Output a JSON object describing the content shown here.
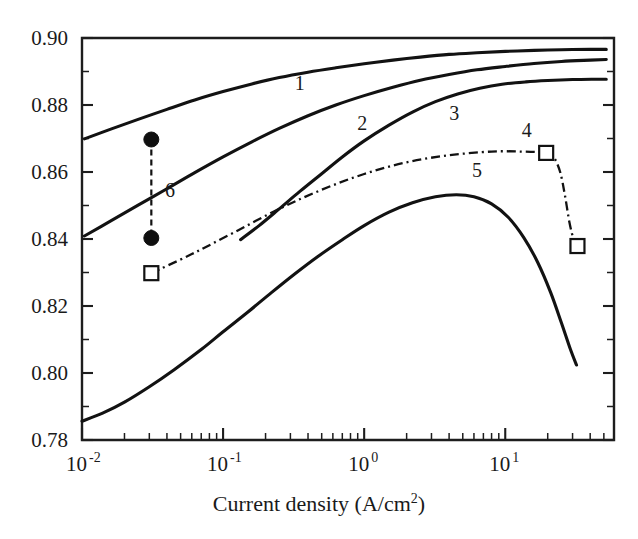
{
  "figure": {
    "background_color": "#ffffff",
    "ink_color": "#121212"
  },
  "chart_data": {
    "type": "line",
    "title": "",
    "xlabel": "Current density (A/cm2)",
    "xlabel_base": "Current density (A/cm",
    "xlabel_sup": "2",
    "xlabel_close": ")",
    "ylabel": "",
    "xscale": "log",
    "yscale": "linear",
    "xlim": [
      0.01,
      59.0
    ],
    "ylim": [
      0.78,
      0.9
    ],
    "grid": false,
    "legend": "inline-curve-numbers",
    "yticks": [
      0.78,
      0.8,
      0.82,
      0.84,
      0.86,
      0.88,
      0.9
    ],
    "ytick_labels": [
      "0.78",
      "0.80",
      "0.82",
      "0.84",
      "0.86",
      "0.88",
      "0.90"
    ],
    "ytick_minor_step": 0.01,
    "xtick_decades": [
      {
        "value": 0.01,
        "base": "10",
        "exponent": "-2"
      },
      {
        "value": 0.1,
        "base": "10",
        "exponent": "-1"
      },
      {
        "value": 1.0,
        "base": "10",
        "exponent": "0"
      },
      {
        "value": 10.0,
        "base": "10",
        "exponent": "1"
      }
    ],
    "series": [
      {
        "name": "1",
        "label": "1",
        "style": "solid",
        "label_x": 0.35,
        "label_y": 0.8845,
        "points": [
          [
            0.0104,
            0.8699
          ],
          [
            0.016,
            0.8728
          ],
          [
            0.025,
            0.8757
          ],
          [
            0.04,
            0.8787
          ],
          [
            0.063,
            0.8815
          ],
          [
            0.1,
            0.884
          ],
          [
            0.16,
            0.8863
          ],
          [
            0.25,
            0.8882
          ],
          [
            0.4,
            0.8898
          ],
          [
            0.63,
            0.8911
          ],
          [
            1.0,
            0.8923
          ],
          [
            1.6,
            0.8934
          ],
          [
            2.5,
            0.8943
          ],
          [
            4.0,
            0.8951
          ],
          [
            6.3,
            0.8956
          ],
          [
            10.0,
            0.896
          ],
          [
            16.0,
            0.8963
          ],
          [
            25.0,
            0.8965
          ],
          [
            40.0,
            0.8966
          ],
          [
            52.0,
            0.8966
          ]
        ]
      },
      {
        "name": "2",
        "label": "2",
        "style": "solid",
        "label_x": 0.97,
        "label_y": 0.8724,
        "points": [
          [
            0.0104,
            0.8409
          ],
          [
            0.016,
            0.8454
          ],
          [
            0.025,
            0.8501
          ],
          [
            0.04,
            0.855
          ],
          [
            0.063,
            0.8598
          ],
          [
            0.1,
            0.8645
          ],
          [
            0.16,
            0.869
          ],
          [
            0.25,
            0.873
          ],
          [
            0.4,
            0.8768
          ],
          [
            0.63,
            0.88
          ],
          [
            1.0,
            0.8828
          ],
          [
            1.6,
            0.8853
          ],
          [
            2.5,
            0.8874
          ],
          [
            4.0,
            0.8891
          ],
          [
            6.3,
            0.8905
          ],
          [
            10.0,
            0.8915
          ],
          [
            16.0,
            0.8924
          ],
          [
            25.0,
            0.893
          ],
          [
            40.0,
            0.8934
          ],
          [
            52.0,
            0.8936
          ]
        ]
      },
      {
        "name": "3",
        "label": "3",
        "style": "solid",
        "label_x": 4.35,
        "label_y": 0.8754,
        "points": [
          [
            0.133,
            0.8398
          ],
          [
            0.18,
            0.844
          ],
          [
            0.25,
            0.849
          ],
          [
            0.35,
            0.8542
          ],
          [
            0.5,
            0.8595
          ],
          [
            0.7,
            0.8645
          ],
          [
            1.0,
            0.8693
          ],
          [
            1.5,
            0.874
          ],
          [
            2.2,
            0.8779
          ],
          [
            3.2,
            0.881
          ],
          [
            4.6,
            0.8833
          ],
          [
            6.6,
            0.885
          ],
          [
            9.5,
            0.8862
          ],
          [
            14.0,
            0.8869
          ],
          [
            20.0,
            0.8873
          ],
          [
            30.0,
            0.8876
          ],
          [
            42.0,
            0.8877
          ],
          [
            52.0,
            0.8877
          ]
        ]
      },
      {
        "name": "4",
        "label": "4",
        "style": "dash-dot",
        "label_x": 14.2,
        "label_y": 0.8705,
        "points": [
          [
            0.031,
            0.8298
          ],
          [
            0.06,
            0.8355
          ],
          [
            0.12,
            0.842
          ],
          [
            0.25,
            0.849
          ],
          [
            0.5,
            0.8547
          ],
          [
            1.0,
            0.8594
          ],
          [
            2.0,
            0.8629
          ],
          [
            4.0,
            0.865
          ],
          [
            8.0,
            0.8661
          ],
          [
            13.0,
            0.8661
          ],
          [
            19.5,
            0.8657
          ],
          [
            22.0,
            0.8645
          ],
          [
            24.5,
            0.86
          ],
          [
            26.5,
            0.853
          ],
          [
            28.5,
            0.845
          ],
          [
            30.5,
            0.84
          ],
          [
            32.5,
            0.8379
          ]
        ],
        "markers": [
          {
            "x": 0.031,
            "y": 0.8298,
            "shape": "open-square"
          },
          {
            "x": 19.5,
            "y": 0.8657,
            "shape": "open-square"
          },
          {
            "x": 32.5,
            "y": 0.8379,
            "shape": "open-square"
          }
        ]
      },
      {
        "name": "5",
        "label": "5",
        "style": "solid",
        "label_x": 6.3,
        "label_y": 0.8585,
        "points": [
          [
            0.01,
            0.7856
          ],
          [
            0.014,
            0.788
          ],
          [
            0.02,
            0.7913
          ],
          [
            0.03,
            0.7959
          ],
          [
            0.045,
            0.801
          ],
          [
            0.07,
            0.807
          ],
          [
            0.1,
            0.8123
          ],
          [
            0.15,
            0.8182
          ],
          [
            0.22,
            0.824
          ],
          [
            0.32,
            0.8295
          ],
          [
            0.47,
            0.8348
          ],
          [
            0.7,
            0.8398
          ],
          [
            1.0,
            0.844
          ],
          [
            1.5,
            0.848
          ],
          [
            2.2,
            0.8508
          ],
          [
            3.2,
            0.8526
          ],
          [
            4.5,
            0.8532
          ],
          [
            6.0,
            0.8526
          ],
          [
            8.0,
            0.8505
          ],
          [
            10.5,
            0.8465
          ],
          [
            13.5,
            0.8405
          ],
          [
            17.0,
            0.833
          ],
          [
            21.0,
            0.824
          ],
          [
            25.0,
            0.815
          ],
          [
            29.0,
            0.807
          ],
          [
            32.0,
            0.8024
          ]
        ]
      },
      {
        "name": "6",
        "label": "6",
        "style": "dashed-vertical",
        "label_x": 0.042,
        "label_y": 0.8525,
        "points": [
          [
            0.031,
            0.8697
          ],
          [
            0.031,
            0.8403
          ]
        ],
        "markers": [
          {
            "x": 0.031,
            "y": 0.8697,
            "shape": "filled-circle"
          },
          {
            "x": 0.031,
            "y": 0.8403,
            "shape": "filled-circle"
          }
        ]
      }
    ]
  }
}
